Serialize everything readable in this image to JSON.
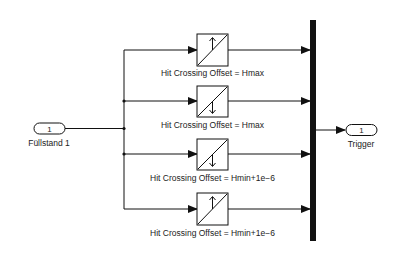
{
  "diagram": {
    "type": "simulink-block-diagram",
    "inport": {
      "number": "1",
      "label": "Füllstand 1"
    },
    "outport": {
      "number": "1",
      "label": "Trigger"
    },
    "hit_crossing_blocks": [
      {
        "label": "Hit Crossing Offset = Hmax",
        "direction": "rising",
        "arrow": "up"
      },
      {
        "label": "Hit Crossing Offset = Hmax",
        "direction": "falling",
        "arrow": "down"
      },
      {
        "label": "Hit Crossing Offset = Hmin+1e−6",
        "direction": "falling",
        "arrow": "down"
      },
      {
        "label": "Hit Crossing Offset = Hmin+1e−6",
        "direction": "rising",
        "arrow": "up"
      }
    ],
    "mux": {
      "type": "bus-bar",
      "inputs": 4
    },
    "colors": {
      "line": "#111111",
      "background": "#ffffff"
    }
  }
}
